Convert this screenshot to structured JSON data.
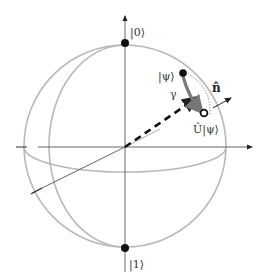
{
  "diagram": {
    "labels": {
      "north_pole": "|0⟩",
      "south_pole": "|1⟩",
      "state": "|ψ⟩",
      "rotated_state": "Û|ψ⟩",
      "axis": "n̂",
      "angle": "γ"
    },
    "colors": {
      "sphere": "#b8b8b8",
      "axes": "#555555",
      "points": "#111111",
      "rotation_arrow": "#777777"
    }
  }
}
